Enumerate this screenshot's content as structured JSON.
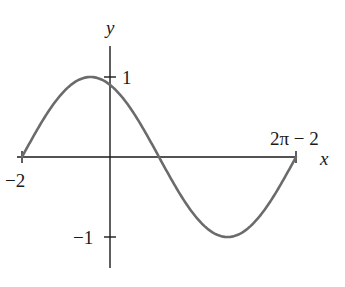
{
  "chart_data": {
    "type": "line",
    "title": "",
    "function": "y = sin(x + 2)",
    "xlabel": "x",
    "ylabel": "y",
    "xlim": [
      -2,
      4.2832
    ],
    "ylim": [
      -1,
      1
    ],
    "grid": false,
    "legend": null,
    "x_tick_labels": [
      {
        "value": -2,
        "label": "−2"
      },
      {
        "value": 4.2832,
        "label": "2π − 2"
      }
    ],
    "y_tick_labels": [
      {
        "value": 1,
        "label": "1"
      },
      {
        "value": -1,
        "label": "−1"
      }
    ],
    "key_points": [
      {
        "x": -2,
        "y": 0,
        "note": "left endpoint"
      },
      {
        "x": -0.4292,
        "y": 1,
        "note": "maximum (π/2 − 2)"
      },
      {
        "x": 1.1416,
        "y": 0,
        "note": "zero crossing (π − 2)"
      },
      {
        "x": 2.7124,
        "y": -1,
        "note": "minimum (3π/2 − 2)"
      },
      {
        "x": 4.2832,
        "y": 0,
        "note": "right endpoint (2π − 2)"
      }
    ],
    "series": [
      {
        "name": "sin(x+2)",
        "color": "#6b6b6b"
      }
    ]
  },
  "labels": {
    "x_axis": "x",
    "y_axis": "y",
    "y_tick_pos": "1",
    "y_tick_neg": "−1",
    "x_tick_left": "−2",
    "x_tick_right": "2π − 2"
  },
  "colors": {
    "axis": "#1a1a1a",
    "curve": "#6b6b6b"
  }
}
